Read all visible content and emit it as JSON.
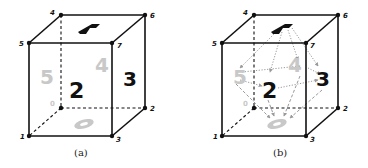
{
  "figure": {
    "panels": [
      {
        "id": "a",
        "caption": "(a)",
        "vertex_labels": {
          "v0": "0",
          "v1": "1",
          "v2": "2",
          "v3": "3",
          "v4": "4",
          "v5": "5",
          "v6": "6",
          "v7": "7"
        },
        "face_labels": {
          "top": "1",
          "left": "5",
          "back": "4",
          "front": "2",
          "right": "3",
          "bottom": "0"
        }
      },
      {
        "id": "b",
        "caption": "(b)",
        "vertex_labels": {
          "v0": "0",
          "v1": "1",
          "v2": "2",
          "v3": "3",
          "v4": "4",
          "v5": "5",
          "v6": "6",
          "v7": "7"
        },
        "face_labels": {
          "top": "1",
          "left": "5",
          "back": "4",
          "front": "2",
          "right": "3",
          "bottom": "0"
        },
        "face_adjacency_arrows": true
      }
    ],
    "colors": {
      "edge": "#111111",
      "dark_face_label": "#111111",
      "light_face_label": "#c8c8c8",
      "adjacency_arrow": "#9a9a9a"
    }
  }
}
